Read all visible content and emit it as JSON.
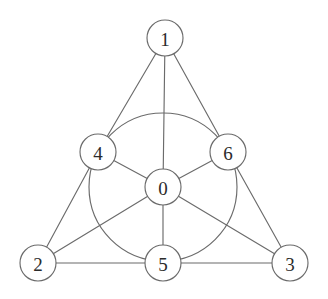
{
  "figure": {
    "background_color": "#ffffff",
    "stroke_color": "#6b6b6b",
    "node_fill_color": "#ffffff",
    "label_color": "#2b2b2b",
    "node_radius": 18,
    "width": 328,
    "height": 299
  },
  "nodes": [
    {
      "id": "0",
      "label": "0",
      "cx": 163,
      "cy": 187,
      "role": "center"
    },
    {
      "id": "1",
      "label": "1",
      "cx": 165,
      "cy": 38,
      "role": "apex"
    },
    {
      "id": "2",
      "label": "2",
      "cx": 38,
      "cy": 263,
      "role": "corner"
    },
    {
      "id": "3",
      "label": "3",
      "cx": 290,
      "cy": 263,
      "role": "corner"
    },
    {
      "id": "4",
      "label": "4",
      "cx": 98,
      "cy": 152,
      "role": "midpoint"
    },
    {
      "id": "5",
      "label": "5",
      "cx": 163,
      "cy": 263,
      "role": "midpoint"
    },
    {
      "id": "6",
      "label": "6",
      "cx": 228,
      "cy": 152,
      "role": "midpoint"
    }
  ],
  "edges": [
    {
      "from": "1",
      "to": "4"
    },
    {
      "from": "4",
      "to": "2"
    },
    {
      "from": "1",
      "to": "6"
    },
    {
      "from": "6",
      "to": "3"
    },
    {
      "from": "2",
      "to": "5"
    },
    {
      "from": "5",
      "to": "3"
    },
    {
      "from": "1",
      "to": "0"
    },
    {
      "from": "0",
      "to": "5"
    },
    {
      "from": "2",
      "to": "0"
    },
    {
      "from": "0",
      "to": "6"
    },
    {
      "from": "3",
      "to": "0"
    },
    {
      "from": "0",
      "to": "4"
    }
  ],
  "inscribed_circle": {
    "name": "incircle-through-4-5-6",
    "cx": 163,
    "cy": 187,
    "r": 74
  }
}
